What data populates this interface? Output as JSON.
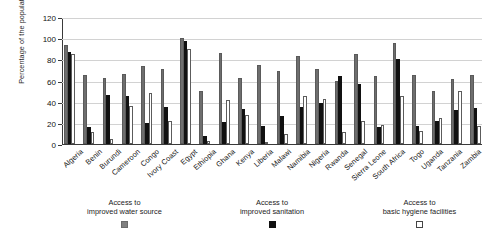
{
  "chart_data": {
    "type": "bar",
    "title": "",
    "xlabel": "",
    "ylabel": "Percentage of the population",
    "ylim": [
      0,
      120
    ],
    "yticks": [
      0,
      20,
      40,
      60,
      80,
      100,
      120
    ],
    "grid": true,
    "legend_position": "bottom",
    "categories": [
      "Algeria",
      "Benin",
      "Burundi",
      "Cameroon",
      "Congo",
      "Ivory Coast",
      "Egypt",
      "Ethiopia",
      "Ghana",
      "Kenya",
      "Liberia",
      "Malawi",
      "Namibia",
      "Nigeria",
      "Rwanda",
      "Senegal",
      "Sierra Leone",
      "South Africa",
      "Togo",
      "Uganda",
      "Tanzania",
      "Zambia"
    ],
    "series": [
      {
        "name": "Access to improved water source",
        "color": "#6e6e6e",
        "values": [
          94,
          65,
          62,
          66,
          74,
          71,
          100,
          50,
          86,
          62,
          75,
          69,
          83,
          71,
          60,
          85,
          64,
          95,
          65,
          50,
          61,
          65
        ]
      },
      {
        "name": "Access to improved sanitation",
        "color": "#111111",
        "values": [
          87,
          16,
          46,
          45,
          20,
          35,
          97,
          8,
          21,
          33,
          17,
          26,
          35,
          39,
          64,
          57,
          16,
          80,
          17,
          22,
          32,
          34
        ]
      },
      {
        "name": "Access to basic hygiene facilities",
        "color": "#ffffff",
        "values": [
          85,
          11,
          5,
          36,
          48,
          22,
          90,
          3,
          42,
          27,
          2,
          9,
          45,
          43,
          11,
          22,
          18,
          45,
          12,
          25,
          50,
          17
        ]
      }
    ]
  },
  "legend": [
    {
      "line1": "Access to",
      "line2": "improved water source",
      "swatch": "gray-square-icon"
    },
    {
      "line1": "Access to",
      "line2": "improved sanitation",
      "swatch": "black-square-icon"
    },
    {
      "line1": "Access to",
      "line2": "basic hygiene facilities",
      "swatch": "white-square-icon"
    }
  ]
}
